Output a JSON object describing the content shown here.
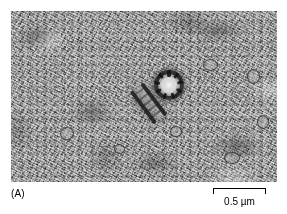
{
  "figure": {
    "panel_letter": "(A)",
    "caption_kind": "electron-micrograph"
  },
  "scale_bar": {
    "label": "0.5 µm",
    "value": 0.5,
    "unit": "µm",
    "length_px": 53,
    "position": "bottom-right"
  },
  "micrograph": {
    "alt": "Transmission electron micrograph of cytoplasm containing a pair of centrioles, one seen in cross section as a ring and one in longitudinal section as a bar",
    "background_color": "#9a9a9a",
    "frame_color": "#ffffff",
    "features": [
      {
        "name": "centriole-cross-section",
        "description": "ring with nine microtubule triplets",
        "triplet_count": 9
      },
      {
        "name": "centriole-longitudinal-section",
        "description": "elongated barrel below and left of the ring"
      },
      {
        "name": "cytoplasm-grain",
        "description": "fine granular ribosome-rich cytoplasm"
      },
      {
        "name": "vesicles",
        "description": "small dark-rimmed membrane vesicles"
      }
    ]
  },
  "colors": {
    "ink": "#000000",
    "paper": "#ffffff",
    "dense_structure": "#1a1a1a",
    "mid_gray": "#9a9a9a"
  }
}
